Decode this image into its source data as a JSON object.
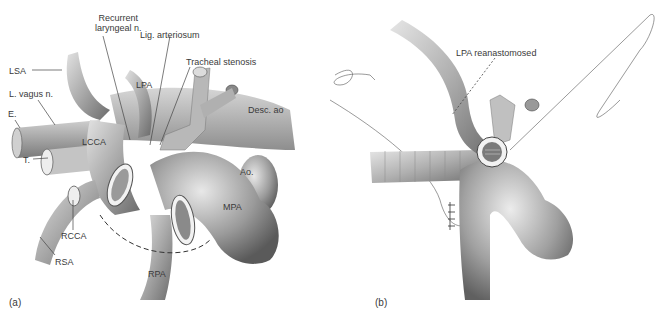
{
  "figure": {
    "panels": [
      {
        "id": "a",
        "tag": "(a)",
        "labels": {
          "recurrent_laryngeal_1": "Recurrent",
          "recurrent_laryngeal_2": "laryngeal n.",
          "lig_arteriosum": "Lig. arteriosum",
          "tracheal_stenosis": "Tracheal stenosis",
          "lsa": "LSA",
          "l_vagus": "L. vagus n.",
          "e": "E.",
          "t": "T.",
          "lpa": "LPA",
          "desc_ao": "Desc. ao",
          "lcca": "LCCA",
          "ao": "Ao.",
          "mpa": "MPA",
          "rcca": "RCCA",
          "rsa": "RSA",
          "rpa": "RPA"
        }
      },
      {
        "id": "b",
        "tag": "(b)",
        "labels": {
          "lpa_reanastomosed": "LPA reanastomosed"
        }
      }
    ],
    "colors": {
      "vessel_dark": "#6e6e6e",
      "vessel_mid": "#a9a9a9",
      "vessel_light": "#d8d8d8",
      "line": "#444444",
      "background": "#ffffff"
    }
  }
}
